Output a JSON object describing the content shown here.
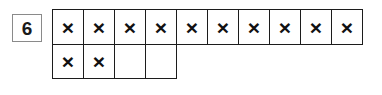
{
  "item": {
    "number": "6"
  },
  "grid": {
    "mark_symbol": "×",
    "rows": [
      {
        "name": "top-row",
        "cells": [
          {
            "marked": true,
            "mark": "×"
          },
          {
            "marked": true,
            "mark": "×"
          },
          {
            "marked": true,
            "mark": "×"
          },
          {
            "marked": true,
            "mark": "×"
          },
          {
            "marked": true,
            "mark": "×"
          },
          {
            "marked": true,
            "mark": "×"
          },
          {
            "marked": true,
            "mark": "×"
          },
          {
            "marked": true,
            "mark": "×"
          },
          {
            "marked": true,
            "mark": "×"
          },
          {
            "marked": true,
            "mark": "×"
          }
        ]
      },
      {
        "name": "bottom-row",
        "cells": [
          {
            "marked": true,
            "mark": "×"
          },
          {
            "marked": true,
            "mark": "×"
          },
          {
            "marked": false,
            "mark": ""
          },
          {
            "marked": false,
            "mark": ""
          }
        ]
      }
    ],
    "marked_count": 12,
    "total_cells": 14,
    "colors": {
      "cell_border": "#1c1c1c",
      "mark": "#111111",
      "number_box_border": "#8a8a8a",
      "background": "#ffffff"
    }
  }
}
